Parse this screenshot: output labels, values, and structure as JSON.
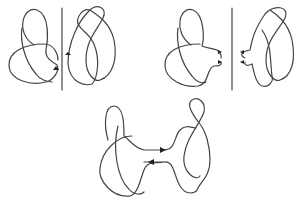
{
  "diagram": {
    "title": "",
    "panels": [
      {
        "id": "separate-knots",
        "description": "trefoil and figure-eight knot separated by a vertical line, each with an orientation arrow"
      },
      {
        "id": "band-preparation",
        "description": "both knots with arcs pulled toward the separating line, arrows indicating band direction"
      },
      {
        "id": "connected-sum",
        "description": "trefoil and figure-eight joined by a band into a single knot, arrows showing orientation"
      }
    ],
    "colors": {
      "stroke": "#444444",
      "background": "#ffffff"
    }
  }
}
